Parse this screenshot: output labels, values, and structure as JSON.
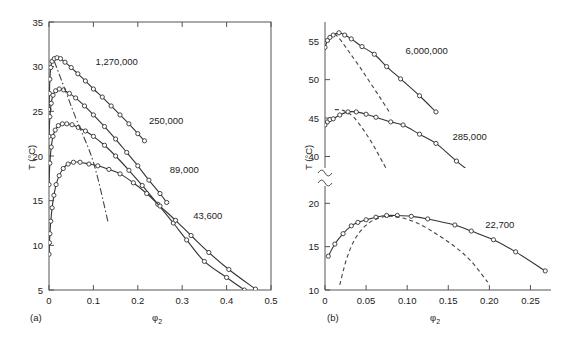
{
  "figure": {
    "panel_a_label": "(a)",
    "panel_b_label": "(b)",
    "y_axis_label": "T (°C)",
    "x_axis_label_main": "φ",
    "x_axis_label_sub": "2"
  },
  "chart_data": [
    {
      "type": "line",
      "panel": "(a)",
      "title": "",
      "xlabel": "φ2",
      "ylabel": "T (°C)",
      "xlim": [
        0,
        0.5
      ],
      "ylim": [
        5,
        35
      ],
      "xticks": [
        0,
        0.1,
        0.2,
        0.3,
        0.4,
        0.5
      ],
      "xticklabels": [
        "0",
        "0.1",
        "0.2",
        "0.3",
        "0.4",
        "0.5"
      ],
      "yticks": [
        5,
        10,
        15,
        20,
        25,
        30,
        35
      ],
      "yticklabels": [
        "5",
        "10",
        "15",
        "20",
        "25",
        "30",
        "35"
      ],
      "grid": false,
      "legend": "inline-annotations",
      "annotations": [
        {
          "text": "1,270,000",
          "x": 0.105,
          "y": 30.2
        },
        {
          "text": "250,000",
          "x": 0.225,
          "y": 23.6
        },
        {
          "text": "89,000",
          "x": 0.272,
          "y": 18.1
        },
        {
          "text": "43,600",
          "x": 0.325,
          "y": 13.0
        }
      ],
      "series": [
        {
          "name": "1,270,000",
          "style": "solid-with-open-circles",
          "points": [
            [
              0.0,
              25.2
            ],
            [
              0.001,
              27.0
            ],
            [
              0.002,
              28.6
            ],
            [
              0.004,
              29.9
            ],
            [
              0.007,
              30.6
            ],
            [
              0.012,
              30.9
            ],
            [
              0.018,
              31.0
            ],
            [
              0.026,
              30.9
            ],
            [
              0.036,
              30.5
            ],
            [
              0.05,
              29.9
            ],
            [
              0.065,
              29.2
            ],
            [
              0.082,
              28.4
            ],
            [
              0.1,
              27.5
            ],
            [
              0.12,
              26.6
            ],
            [
              0.14,
              25.6
            ],
            [
              0.16,
              24.6
            ],
            [
              0.18,
              23.6
            ],
            [
              0.2,
              22.5
            ],
            [
              0.215,
              21.7
            ]
          ]
        },
        {
          "name": "250,000",
          "style": "solid-with-open-circles",
          "points": [
            [
              0.0,
              22.2
            ],
            [
              0.002,
              24.4
            ],
            [
              0.005,
              25.9
            ],
            [
              0.009,
              26.8
            ],
            [
              0.015,
              27.3
            ],
            [
              0.023,
              27.5
            ],
            [
              0.033,
              27.4
            ],
            [
              0.046,
              27.0
            ],
            [
              0.06,
              26.5
            ],
            [
              0.08,
              25.6
            ],
            [
              0.1,
              24.6
            ],
            [
              0.125,
              23.3
            ],
            [
              0.15,
              21.9
            ],
            [
              0.175,
              20.4
            ],
            [
              0.2,
              18.9
            ],
            [
              0.225,
              17.3
            ],
            [
              0.25,
              15.8
            ],
            [
              0.265,
              14.8
            ]
          ]
        },
        {
          "name": "89,000",
          "style": "solid-with-open-circles",
          "points": [
            [
              0.0,
              16.8
            ],
            [
              0.002,
              19.2
            ],
            [
              0.005,
              21.0
            ],
            [
              0.009,
              22.2
            ],
            [
              0.014,
              22.9
            ],
            [
              0.021,
              23.4
            ],
            [
              0.03,
              23.6
            ],
            [
              0.04,
              23.6
            ],
            [
              0.052,
              23.5
            ],
            [
              0.066,
              23.2
            ],
            [
              0.082,
              22.8
            ],
            [
              0.1,
              22.2
            ],
            [
              0.125,
              21.2
            ],
            [
              0.15,
              20.0
            ],
            [
              0.18,
              18.4
            ],
            [
              0.21,
              16.7
            ],
            [
              0.245,
              14.6
            ],
            [
              0.28,
              12.5
            ],
            [
              0.31,
              10.6
            ],
            [
              0.35,
              8.2
            ],
            [
              0.4,
              6.4
            ],
            [
              0.44,
              5.0
            ]
          ]
        },
        {
          "name": "43,600",
          "style": "solid-with-open-circles",
          "points": [
            [
              0.0,
              9.0
            ],
            [
              0.001,
              10.3
            ],
            [
              0.002,
              11.3
            ],
            [
              0.004,
              12.7
            ],
            [
              0.007,
              14.2
            ],
            [
              0.011,
              15.6
            ],
            [
              0.016,
              16.8
            ],
            [
              0.023,
              17.8
            ],
            [
              0.032,
              18.6
            ],
            [
              0.043,
              19.1
            ],
            [
              0.055,
              19.3
            ],
            [
              0.07,
              19.3
            ],
            [
              0.09,
              19.1
            ],
            [
              0.11,
              18.9
            ],
            [
              0.135,
              18.5
            ],
            [
              0.16,
              18.0
            ],
            [
              0.19,
              17.0
            ],
            [
              0.22,
              15.8
            ],
            [
              0.25,
              14.4
            ],
            [
              0.285,
              12.8
            ],
            [
              0.32,
              11.1
            ],
            [
              0.36,
              9.2
            ],
            [
              0.405,
              7.3
            ],
            [
              0.465,
              5.1
            ]
          ]
        },
        {
          "name": "critical-locus",
          "style": "dash-dot",
          "points": [
            [
              0.012,
              30.6
            ],
            [
              0.06,
              24.3
            ],
            [
              0.1,
              19.3
            ],
            [
              0.133,
              12.6
            ]
          ]
        }
      ]
    },
    {
      "type": "line",
      "panel": "(b)",
      "title": "",
      "xlabel": "φ2",
      "ylabel": "T (°C)",
      "xlim": [
        0,
        0.275
      ],
      "ylim_upper": [
        38.5,
        57.5
      ],
      "ylim_lower": [
        10,
        22
      ],
      "axis_break": true,
      "xticks": [
        0,
        0.05,
        0.1,
        0.15,
        0.2,
        0.25
      ],
      "xticklabels": [
        "0",
        "0.05",
        "0.10",
        "0.15",
        "0.20",
        "0.25"
      ],
      "yticks_upper": [
        40,
        45,
        50,
        55
      ],
      "yticklabels_upper": [
        "40",
        "45",
        "50",
        "55"
      ],
      "yticks_lower": [
        10,
        15,
        20
      ],
      "yticklabels_lower": [
        "10",
        "15",
        "20"
      ],
      "grid": false,
      "legend": "inline-annotations",
      "annotations": [
        {
          "text": "6,000,000",
          "x": 0.098,
          "y": 53.3
        },
        {
          "text": "285,000",
          "x": 0.155,
          "y": 42.2
        },
        {
          "text": "22,700",
          "x": 0.195,
          "y": 17.1
        }
      ],
      "series": [
        {
          "name": "6,000,000",
          "style": "solid-with-open-circles",
          "points": [
            [
              0.0,
              54.2
            ],
            [
              0.003,
              55.1
            ],
            [
              0.006,
              55.5
            ],
            [
              0.01,
              55.8
            ],
            [
              0.017,
              56.1
            ],
            [
              0.024,
              55.8
            ],
            [
              0.032,
              55.3
            ],
            [
              0.045,
              54.3
            ],
            [
              0.06,
              53.3
            ],
            [
              0.075,
              51.7
            ],
            [
              0.092,
              50.1
            ],
            [
              0.115,
              47.9
            ],
            [
              0.135,
              45.8
            ]
          ]
        },
        {
          "name": "6,000,000-theory",
          "style": "dashed",
          "points": [
            [
              0.012,
              56.0
            ],
            [
              0.02,
              55.0
            ],
            [
              0.03,
              53.5
            ],
            [
              0.042,
              51.7
            ],
            [
              0.055,
              49.6
            ],
            [
              0.068,
              47.5
            ],
            [
              0.08,
              45.5
            ]
          ]
        },
        {
          "name": "285,000",
          "style": "solid-with-open-circles",
          "points": [
            [
              0.0,
              44.1
            ],
            [
              0.003,
              44.5
            ],
            [
              0.006,
              44.8
            ],
            [
              0.01,
              44.9
            ],
            [
              0.018,
              45.4
            ],
            [
              0.028,
              45.8
            ],
            [
              0.038,
              45.8
            ],
            [
              0.05,
              45.5
            ],
            [
              0.062,
              45.1
            ],
            [
              0.08,
              44.5
            ],
            [
              0.095,
              44.1
            ],
            [
              0.115,
              42.9
            ],
            [
              0.135,
              41.7
            ],
            [
              0.16,
              39.4
            ],
            [
              0.185,
              37.3
            ]
          ]
        },
        {
          "name": "285,000-theory",
          "style": "dashed",
          "points": [
            [
              0.012,
              46.1
            ],
            [
              0.022,
              46.0
            ],
            [
              0.034,
              45.2
            ],
            [
              0.046,
              43.6
            ],
            [
              0.058,
              41.6
            ],
            [
              0.07,
              39.3
            ],
            [
              0.082,
              37.0
            ]
          ]
        },
        {
          "name": "22,700",
          "style": "solid-with-open-circles",
          "points": [
            [
              0.004,
              13.9
            ],
            [
              0.012,
              15.3
            ],
            [
              0.022,
              16.5
            ],
            [
              0.032,
              17.4
            ],
            [
              0.04,
              17.8
            ],
            [
              0.05,
              18.1
            ],
            [
              0.062,
              18.4
            ],
            [
              0.075,
              18.6
            ],
            [
              0.088,
              18.6
            ],
            [
              0.105,
              18.5
            ],
            [
              0.125,
              18.2
            ],
            [
              0.158,
              17.5
            ],
            [
              0.178,
              16.8
            ],
            [
              0.205,
              15.8
            ],
            [
              0.232,
              14.4
            ],
            [
              0.268,
              12.2
            ]
          ]
        },
        {
          "name": "22,700-theory",
          "style": "dashed",
          "points": [
            [
              0.018,
              10.6
            ],
            [
              0.026,
              13.5
            ],
            [
              0.036,
              15.8
            ],
            [
              0.048,
              17.3
            ],
            [
              0.062,
              18.2
            ],
            [
              0.078,
              18.5
            ],
            [
              0.095,
              18.3
            ],
            [
              0.115,
              17.6
            ],
            [
              0.135,
              16.5
            ],
            [
              0.158,
              15.0
            ],
            [
              0.178,
              13.3
            ],
            [
              0.198,
              10.9
            ]
          ]
        }
      ]
    }
  ]
}
